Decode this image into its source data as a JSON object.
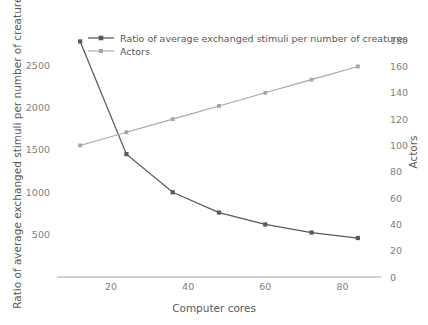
{
  "chart_data": {
    "type": "line",
    "title": "",
    "xlabel": "Computer cores",
    "ylabel": "Ratio of average exchanged stimuli per number of creatures",
    "y2label": "Actors",
    "x": [
      12,
      24,
      36,
      48,
      60,
      72,
      84
    ],
    "xlim": [
      6,
      90
    ],
    "xticks": [
      20,
      40,
      60,
      80
    ],
    "xtick_labels": [
      "20",
      "40",
      "60",
      "80"
    ],
    "ylim": [
      0,
      2950
    ],
    "yticks": [
      500,
      1000,
      1500,
      2000,
      2500
    ],
    "ytick_labels": [
      "500",
      "1000",
      "1500",
      "2000",
      "2500"
    ],
    "y2lim": [
      0,
      190
    ],
    "y2ticks": [
      0,
      20,
      40,
      60,
      80,
      100,
      120,
      140,
      160,
      180
    ],
    "y2tick_labels": [
      "0",
      "20",
      "40",
      "60",
      "80",
      "100",
      "120",
      "140",
      "160",
      "180"
    ],
    "grid": false,
    "legend_position": "top-center",
    "series": [
      {
        "name": "Ratio of average exchanged stimuli per number of creatures",
        "axis": "left",
        "color": "#595959",
        "marker": "square",
        "values": [
          2780,
          1450,
          1000,
          760,
          620,
          525,
          460
        ]
      },
      {
        "name": "Actors",
        "axis": "right",
        "color": "#a6a6a6",
        "marker": "square",
        "values": [
          100,
          110,
          120,
          130,
          140,
          150,
          160
        ]
      }
    ]
  },
  "legend": {
    "items": [
      {
        "label": "Ratio of average exchanged stimuli per number of creatures"
      },
      {
        "label": "Actors"
      }
    ]
  },
  "colors": {
    "series1": "#595959",
    "series2": "#a6a6a6",
    "axis": "#a6a6a6",
    "text": "#808080",
    "background": "#ffffff"
  }
}
